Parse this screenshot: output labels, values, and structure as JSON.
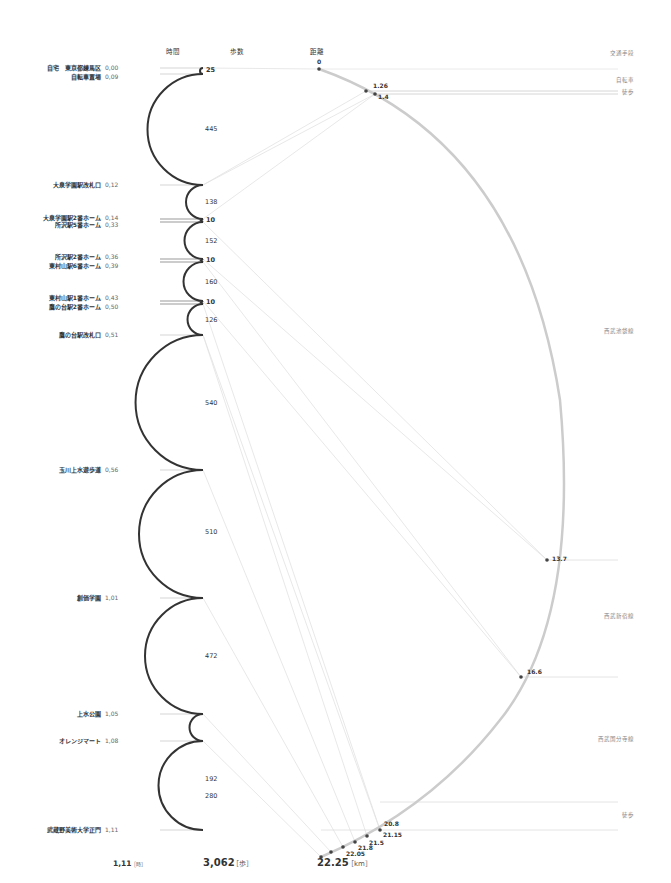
{
  "headers": {
    "time": "時間",
    "steps": "歩数",
    "distance": "距離",
    "transport": "交通手段"
  },
  "places": [
    {
      "name": "自宅　東京都練馬区",
      "time": "0,00"
    },
    {
      "name": "自転車置場",
      "time": "0,09"
    },
    {
      "name": "大泉学園駅改札口",
      "time": "0,12"
    },
    {
      "name": "大泉学園駅2番ホーム",
      "time": "0,14"
    },
    {
      "name": "所沢駅5番ホーム",
      "time": "0,33"
    },
    {
      "name": "所沢駅2番ホーム",
      "time": "0,36"
    },
    {
      "name": "東村山駅6番ホーム",
      "time": "0,39"
    },
    {
      "name": "東村山駅1番ホーム",
      "time": "0,43"
    },
    {
      "name": "鷹の台駅2番ホーム",
      "time": "0,50"
    },
    {
      "name": "鷹の台駅改札口",
      "time": "0,51"
    },
    {
      "name": "玉川上水遊歩道",
      "time": "0,56"
    },
    {
      "name": "創価学園",
      "time": "1,01"
    },
    {
      "name": "上水公園",
      "time": "1,05"
    },
    {
      "name": "オレンジマート",
      "time": "1,08"
    },
    {
      "name": "武蔵野美術大学正門",
      "time": "1,11"
    }
  ],
  "steps": [
    "25",
    "445",
    "138",
    "10",
    "152",
    "10",
    "160",
    "10",
    "126",
    "540",
    "510",
    "472",
    "192",
    "280"
  ],
  "distances": [
    "0",
    "1.26",
    "1.4",
    "13.7",
    "16.6",
    "20.8",
    "21.15",
    "21.5",
    "21.8",
    "22.05",
    "22.25"
  ],
  "transport": [
    {
      "label": "自転車"
    },
    {
      "label": "徒歩"
    },
    {
      "label": "西武池袋線"
    },
    {
      "label": "西武新宿線"
    },
    {
      "label": "西武国分寺線"
    },
    {
      "label": "徒歩"
    }
  ],
  "totals": {
    "time_value": "1,11",
    "time_unit": "［時］",
    "steps_value": "3,062",
    "steps_unit": "［歩］",
    "distance_value": "22.25",
    "distance_unit": "［km］"
  },
  "chart_data": {
    "type": "diagram",
    "title": "",
    "segments_steps": [
      25,
      445,
      138,
      10,
      152,
      10,
      160,
      10,
      126,
      540,
      510,
      472,
      192,
      280
    ],
    "distance_km": [
      0,
      1.26,
      1.4,
      13.7,
      16.6,
      20.8,
      21.15,
      21.5,
      21.8,
      22.05,
      22.25
    ],
    "total_time": "1,11",
    "total_steps": 3062,
    "total_distance_km": 22.25
  }
}
